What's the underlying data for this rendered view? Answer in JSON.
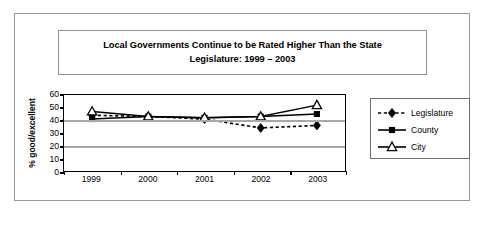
{
  "chart_data": {
    "type": "line",
    "title": "Local Governments Continue to be Rated Higher Than the State Legislature: 1999 – 2003",
    "title_line1": "Local Governments Continue to be Rated Higher Than the State",
    "title_line2": "Legislature: 1999 – 2003",
    "xlabel": "",
    "ylabel": "% good/excellent",
    "categories": [
      "1999",
      "2000",
      "2001",
      "2002",
      "2003"
    ],
    "ylim": [
      0,
      60
    ],
    "yticks": [
      0,
      10,
      20,
      30,
      40,
      50,
      60
    ],
    "gridlines": [
      20,
      40
    ],
    "grid": true,
    "legend_position": "right",
    "series": [
      {
        "name": "Legislature",
        "values": [
          44,
          43,
          41,
          34,
          36
        ],
        "marker": "diamond-filled",
        "line_style": "dashed",
        "color": "#000000"
      },
      {
        "name": "County",
        "values": [
          41,
          43,
          42,
          43,
          45
        ],
        "marker": "square-filled",
        "line_style": "solid",
        "color": "#000000"
      },
      {
        "name": "City",
        "values": [
          47,
          43,
          42,
          43,
          52
        ],
        "marker": "triangle-open",
        "line_style": "solid",
        "color": "#000000"
      }
    ]
  },
  "colors": {
    "gridline": "#a8a8a8",
    "axis": "#000000",
    "frame": "#9a9a9a",
    "background": "#ffffff"
  }
}
